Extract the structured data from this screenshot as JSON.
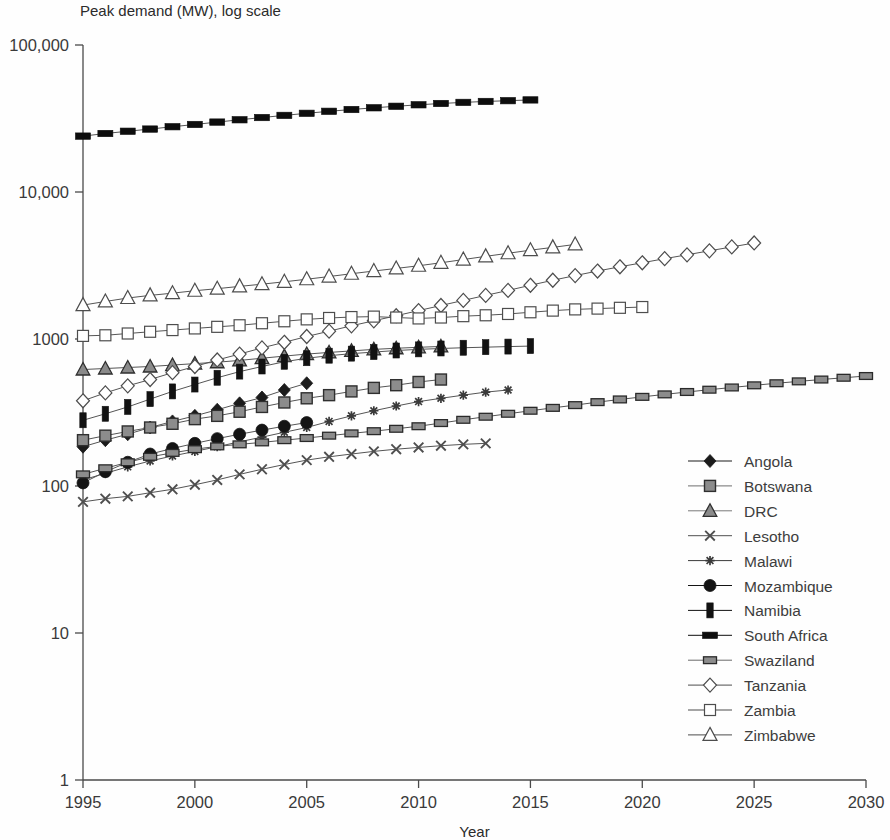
{
  "chart_data": {
    "type": "line",
    "title": "Peak demand (MW), log scale",
    "xlabel": "Year",
    "ylabel": "",
    "yscale": "log",
    "xlim": [
      1995,
      2030
    ],
    "ylim": [
      1,
      100000
    ],
    "grid": false,
    "legend_position": "bottom-right",
    "xticks": [
      "1995",
      "2000",
      "2005",
      "2010",
      "2015",
      "2020",
      "2025",
      "2030"
    ],
    "xtick_values": [
      1995,
      2000,
      2005,
      2010,
      2015,
      2020,
      2025,
      2030
    ],
    "yticks": [
      "100,000",
      "10,000",
      "1000",
      "100",
      "10",
      "1"
    ],
    "ytick_values": [
      100000,
      10000,
      1000,
      100,
      10,
      1
    ],
    "series": [
      {
        "name": "Angola",
        "marker": "filled-diamond",
        "color": "#1b1b1b",
        "x": [
          1995,
          1996,
          1997,
          1998,
          1999,
          2000,
          2001,
          2002,
          2003,
          2004,
          2005
        ],
        "values": [
          185,
          205,
          225,
          250,
          275,
          300,
          330,
          365,
          400,
          450,
          500
        ]
      },
      {
        "name": "Botswana",
        "marker": "grey-square",
        "color": "#6e6e6e",
        "x": [
          1995,
          1996,
          1997,
          1998,
          1999,
          2000,
          2001,
          2002,
          2003,
          2004,
          2005,
          2006,
          2007,
          2008,
          2009,
          2010,
          2011
        ],
        "values": [
          205,
          220,
          235,
          250,
          265,
          285,
          300,
          320,
          345,
          370,
          395,
          415,
          440,
          465,
          485,
          510,
          530
        ]
      },
      {
        "name": "DRC",
        "marker": "grey-triangle",
        "color": "#7a7a7a",
        "x": [
          1995,
          1996,
          1997,
          1998,
          1999,
          2000,
          2001,
          2002,
          2003,
          2004,
          2005,
          2006,
          2007,
          2008,
          2009,
          2010,
          2011
        ],
        "values": [
          620,
          630,
          640,
          650,
          665,
          680,
          695,
          715,
          740,
          765,
          790,
          810,
          830,
          850,
          865,
          878,
          890
        ]
      },
      {
        "name": "Lesotho",
        "marker": "cross-x",
        "color": "#4f4f4f",
        "x": [
          1995,
          1996,
          1997,
          1998,
          1999,
          2000,
          2001,
          2002,
          2003,
          2004,
          2005,
          2006,
          2007,
          2008,
          2009,
          2010,
          2011,
          2012,
          2013
        ],
        "values": [
          78,
          82,
          85,
          90,
          95,
          102,
          110,
          120,
          130,
          140,
          150,
          158,
          165,
          172,
          178,
          183,
          188,
          192,
          195
        ]
      },
      {
        "name": "Malawi",
        "marker": "small-star",
        "color": "#3a3a3a",
        "x": [
          1995,
          1996,
          1997,
          1998,
          1999,
          2000,
          2001,
          2002,
          2003,
          2004,
          2005,
          2006,
          2007,
          2008,
          2009,
          2010,
          2011,
          2012,
          2013,
          2014
        ],
        "values": [
          110,
          122,
          135,
          148,
          160,
          172,
          185,
          200,
          215,
          232,
          250,
          275,
          300,
          325,
          350,
          375,
          395,
          415,
          435,
          450
        ]
      },
      {
        "name": "Mozambique",
        "marker": "filled-circle",
        "color": "#141414",
        "x": [
          1995,
          1996,
          1997,
          1998,
          1999,
          2000,
          2001,
          2002,
          2003,
          2004,
          2005
        ],
        "values": [
          105,
          125,
          145,
          165,
          180,
          195,
          210,
          225,
          240,
          255,
          270
        ]
      },
      {
        "name": "Namibia",
        "marker": "filled-bar",
        "color": "#121212",
        "x": [
          1995,
          1996,
          1997,
          1998,
          1999,
          2000,
          2001,
          2002,
          2003,
          2004,
          2005,
          2006,
          2007,
          2008,
          2009,
          2010,
          2011,
          2012,
          2013,
          2014,
          2015
        ],
        "values": [
          280,
          310,
          345,
          390,
          440,
          490,
          545,
          600,
          650,
          700,
          740,
          770,
          795,
          815,
          835,
          850,
          862,
          872,
          880,
          888,
          895
        ]
      },
      {
        "name": "South Africa",
        "marker": "filled-rect",
        "color": "#0d0d0d",
        "x": [
          1995,
          1996,
          1997,
          1998,
          1999,
          2000,
          2001,
          2002,
          2003,
          2004,
          2005,
          2006,
          2007,
          2008,
          2009,
          2010,
          2011,
          2012,
          2013,
          2014,
          2015
        ],
        "values": [
          24000,
          25000,
          25900,
          26800,
          27800,
          28800,
          29900,
          31000,
          32100,
          33200,
          34300,
          35400,
          36400,
          37400,
          38300,
          39200,
          40000,
          40700,
          41300,
          41800,
          42300
        ]
      },
      {
        "name": "Swaziland",
        "marker": "grey-rect",
        "color": "#6b6b6b",
        "x": [
          1995,
          1996,
          1997,
          1998,
          1999,
          2000,
          2001,
          2002,
          2003,
          2004,
          2005,
          2006,
          2007,
          2008,
          2009,
          2010,
          2011,
          2012,
          2013,
          2014,
          2015,
          2016,
          2017,
          2018,
          2019,
          2020,
          2021,
          2022,
          2023,
          2024,
          2025,
          2026,
          2027,
          2028,
          2029,
          2030
        ],
        "values": [
          120,
          132,
          145,
          158,
          168,
          178,
          186,
          192,
          198,
          205,
          212,
          220,
          228,
          236,
          245,
          255,
          268,
          282,
          296,
          310,
          325,
          340,
          355,
          372,
          388,
          404,
          420,
          436,
          452,
          468,
          484,
          500,
          515,
          530,
          545,
          560
        ]
      },
      {
        "name": "Tanzania",
        "marker": "open-diamond",
        "color": "#4d4d4d",
        "x": [
          1995,
          1996,
          1997,
          1998,
          1999,
          2000,
          2001,
          2002,
          2003,
          2004,
          2005,
          2006,
          2007,
          2008,
          2009,
          2010,
          2011,
          2012,
          2013,
          2014,
          2015,
          2016,
          2017,
          2018,
          2019,
          2020,
          2021,
          2022,
          2023,
          2024,
          2025
        ],
        "values": [
          380,
          430,
          480,
          530,
          590,
          650,
          720,
          790,
          870,
          950,
          1040,
          1130,
          1230,
          1330,
          1440,
          1560,
          1690,
          1830,
          1980,
          2140,
          2320,
          2510,
          2700,
          2900,
          3100,
          3300,
          3520,
          3740,
          3980,
          4230,
          4500
        ]
      },
      {
        "name": "Zambia",
        "marker": "open-square",
        "color": "#4d4d4d",
        "x": [
          1995,
          1996,
          1997,
          1998,
          1999,
          2000,
          2001,
          2002,
          2003,
          2004,
          2005,
          2006,
          2007,
          2008,
          2009,
          2010,
          2011,
          2012,
          2013,
          2014,
          2015,
          2016,
          2017,
          2018,
          2019,
          2020
        ],
        "values": [
          1050,
          1060,
          1090,
          1120,
          1150,
          1180,
          1210,
          1240,
          1280,
          1320,
          1360,
          1390,
          1410,
          1420,
          1400,
          1380,
          1400,
          1430,
          1450,
          1480,
          1520,
          1560,
          1590,
          1610,
          1630,
          1650
        ]
      },
      {
        "name": "Zimbabwe",
        "marker": "open-triangle",
        "color": "#4d4d4d",
        "x": [
          1995,
          1996,
          1997,
          1998,
          1999,
          2000,
          2001,
          2002,
          2003,
          2004,
          2005,
          2006,
          2007,
          2008,
          2009,
          2010,
          2011,
          2012,
          2013,
          2014,
          2015,
          2016,
          2017
        ],
        "values": [
          1700,
          1800,
          1900,
          1980,
          2050,
          2130,
          2200,
          2280,
          2360,
          2450,
          2550,
          2660,
          2780,
          2900,
          3020,
          3150,
          3300,
          3470,
          3650,
          3830,
          4020,
          4200,
          4400
        ]
      }
    ]
  }
}
